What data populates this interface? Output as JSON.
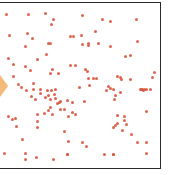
{
  "game": {
    "field": {
      "border_color": "#2a2a2a",
      "background": "#ffffff",
      "bounds": {
        "left": -2,
        "top": 2,
        "right": 161,
        "bottom": 169
      }
    },
    "player": {
      "shape": "diamond",
      "color": "#f4b26a",
      "center": [
        0,
        86
      ],
      "size": [
        16,
        22
      ]
    },
    "dot_color": "#d9533b",
    "dots": [
      [
        6,
        14
      ],
      [
        28,
        14
      ],
      [
        45,
        13
      ],
      [
        51,
        24
      ],
      [
        53,
        19
      ],
      [
        82,
        15
      ],
      [
        102,
        19
      ],
      [
        110,
        21
      ],
      [
        136,
        19
      ],
      [
        9,
        35
      ],
      [
        27,
        33
      ],
      [
        32,
        38
      ],
      [
        48,
        43
      ],
      [
        50,
        43
      ],
      [
        25,
        46
      ],
      [
        46,
        54
      ],
      [
        37,
        59
      ],
      [
        70,
        36
      ],
      [
        73,
        36
      ],
      [
        81,
        35
      ],
      [
        95,
        31
      ],
      [
        82,
        44
      ],
      [
        88,
        45
      ],
      [
        88,
        43
      ],
      [
        98,
        43
      ],
      [
        110,
        46
      ],
      [
        137,
        41
      ],
      [
        8,
        58
      ],
      [
        13,
        64
      ],
      [
        30,
        70
      ],
      [
        13,
        76
      ],
      [
        25,
        66
      ],
      [
        50,
        73
      ],
      [
        52,
        69
      ],
      [
        58,
        73
      ],
      [
        18,
        84
      ],
      [
        21,
        87
      ],
      [
        26,
        90
      ],
      [
        31,
        96
      ],
      [
        35,
        99
      ],
      [
        33,
        83
      ],
      [
        33,
        89
      ],
      [
        55,
        89
      ],
      [
        47,
        90
      ],
      [
        45,
        97
      ],
      [
        50,
        99
      ],
      [
        50,
        107
      ],
      [
        59,
        102
      ],
      [
        60,
        109
      ],
      [
        70,
        65
      ],
      [
        75,
        65
      ],
      [
        85,
        69
      ],
      [
        87,
        71
      ],
      [
        93,
        78
      ],
      [
        96,
        78
      ],
      [
        108,
        86
      ],
      [
        113,
        89
      ],
      [
        88,
        78
      ],
      [
        117,
        76
      ],
      [
        125,
        56
      ],
      [
        130,
        55
      ],
      [
        154,
        72
      ],
      [
        121,
        79
      ],
      [
        120,
        77
      ],
      [
        110,
        88
      ],
      [
        130,
        79
      ],
      [
        120,
        92
      ],
      [
        146,
        89
      ],
      [
        141,
        89
      ],
      [
        146,
        111
      ],
      [
        142,
        89
      ],
      [
        144,
        89
      ],
      [
        140,
        89
      ],
      [
        143,
        90
      ],
      [
        150,
        89
      ],
      [
        152,
        77
      ],
      [
        51,
        90
      ],
      [
        40,
        89
      ],
      [
        40,
        93
      ],
      [
        48,
        95
      ],
      [
        54,
        94
      ],
      [
        55,
        98
      ],
      [
        64,
        109
      ],
      [
        67,
        100
      ],
      [
        60,
        101
      ],
      [
        84,
        101
      ],
      [
        57,
        103
      ],
      [
        72,
        102
      ],
      [
        79,
        87
      ],
      [
        89,
        85
      ],
      [
        106,
        90
      ],
      [
        115,
        95
      ],
      [
        114,
        99
      ],
      [
        8,
        116
      ],
      [
        12,
        119
      ],
      [
        15,
        118
      ],
      [
        16,
        126
      ],
      [
        44,
        113
      ],
      [
        48,
        110
      ],
      [
        52,
        114
      ],
      [
        37,
        114
      ],
      [
        37,
        121
      ],
      [
        37,
        127
      ],
      [
        22,
        139
      ],
      [
        4,
        153
      ],
      [
        25,
        153
      ],
      [
        25,
        159
      ],
      [
        36,
        157
      ],
      [
        53,
        159
      ],
      [
        68,
        116
      ],
      [
        72,
        112
      ],
      [
        75,
        114
      ],
      [
        64,
        131
      ],
      [
        82,
        142
      ],
      [
        68,
        141
      ],
      [
        86,
        146
      ],
      [
        67,
        154
      ],
      [
        67,
        154
      ],
      [
        104,
        154
      ],
      [
        113,
        154
      ],
      [
        117,
        115
      ],
      [
        124,
        116
      ],
      [
        124,
        120
      ],
      [
        117,
        123
      ],
      [
        126,
        124
      ],
      [
        122,
        130
      ],
      [
        131,
        134
      ],
      [
        115,
        125
      ],
      [
        113,
        127
      ],
      [
        137,
        142
      ],
      [
        113,
        154
      ],
      [
        146,
        142
      ],
      [
        146,
        153
      ]
    ]
  }
}
